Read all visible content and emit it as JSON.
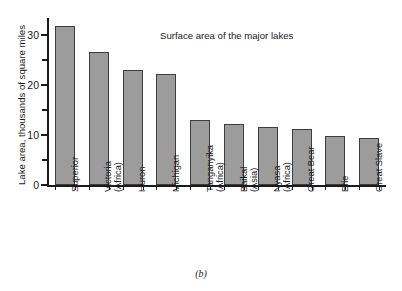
{
  "figure": {
    "caption": "(b)",
    "background_color": "#ffffff",
    "bar_fill_color": "#9c9c9c",
    "bar_border_color": "#3d3d3d",
    "axis_color": "#1a1a1a"
  },
  "chart_data": {
    "type": "bar",
    "title": "Surface area of the major lakes",
    "xlabel": "",
    "ylabel": "Lake area, thousands of square miles",
    "ylim": [
      0,
      33
    ],
    "grid": false,
    "legend": null,
    "y_major_ticks": [
      0,
      10,
      20,
      30
    ],
    "y_minor_ticks": [
      5,
      15,
      25
    ],
    "y_tick_labels": [
      "0",
      "10",
      "20",
      "30"
    ],
    "categories": [
      "Superior",
      "Victoria (Africa)",
      "Huron",
      "Michigan",
      "Tanganyika (Africa)",
      "Baikal (Asia)",
      "Nyasa (Africa)",
      "Great Bear",
      "Erie",
      "Great Slave"
    ],
    "category_labels": [
      {
        "line1": "Superior",
        "line2": ""
      },
      {
        "line1": "Victoria",
        "line2": "(Africa)"
      },
      {
        "line1": "Huron",
        "line2": ""
      },
      {
        "line1": "Michigan",
        "line2": ""
      },
      {
        "line1": "Tanganyika",
        "line2": "(Africa)"
      },
      {
        "line1": "Baikal",
        "line2": "(Asia)"
      },
      {
        "line1": "Nyasa",
        "line2": "(Africa)"
      },
      {
        "line1": "Great Bear",
        "line2": ""
      },
      {
        "line1": "Erie",
        "line2": ""
      },
      {
        "line1": "Great Slave",
        "line2": ""
      }
    ],
    "values": [
      31.8,
      26.7,
      23.0,
      22.3,
      13.1,
      12.2,
      11.7,
      11.3,
      9.9,
      9.5
    ]
  }
}
